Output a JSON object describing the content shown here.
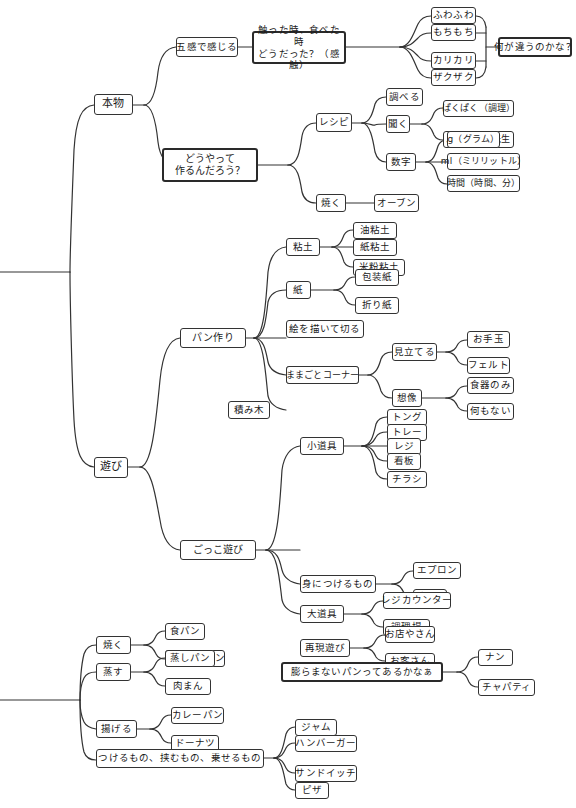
{
  "diagram": {
    "type": "mind-map",
    "language": "ja",
    "root_label": "",
    "nodes": {
      "honmono": "本物",
      "asobi": "遊び",
      "gokan": "五感で感じる",
      "sawatta": "触った時、食べた時\nどうだった？（感触）",
      "fuwafuwa": "ふわふわ",
      "mochimochi": "もちもち",
      "karikari": "カリカリ",
      "zakuzaku": "ザクザク",
      "nanigachigau": "何が違うのかな？",
      "douyatte": "どうやって\n作るんだろう？",
      "recipe": "レシピ",
      "shiraberu": "調べる",
      "kiku": "聞く",
      "pakupaku": "ぱくぱく（調理）",
      "pankyoushitsu": "パン教室の先生",
      "suuji": "数字",
      "gram": "g（グラム）",
      "ml": "ml（ミリリットル）",
      "jikan": "時間（時間、分）",
      "yaku_honmono": "焼く",
      "oven": "オーブン",
      "panzukuri": "パン作り",
      "nendo": "粘土",
      "abura_nendo": "油粘土",
      "kami_nendo": "紙粘土",
      "komeko_nendo": "米粉粘土",
      "kami": "紙",
      "housoushi": "包装紙",
      "origami": "折り紙",
      "e_wo_kaite": "絵を描いて切る",
      "mamagoto": "ままごとコーナー",
      "mitateru": "見立てる",
      "otedama": "お手玉",
      "felt": "フェルト",
      "souzou": "想像",
      "shokki_nomi": "食器のみ",
      "nanimonai": "何もない",
      "tsumiki": "積み木",
      "gokko": "ごっこ遊び",
      "kodougu": "小道具",
      "tong": "トング",
      "tray": "トレー",
      "reji": "レジ",
      "kanban": "看板",
      "chirashi": "チラシ",
      "mi_ni_tsukeru": "身につけるもの",
      "apron": "エプロン",
      "boushi": "帽子",
      "oodougu": "大道具",
      "reji_counter": "レジカウンター",
      "chourijou": "調理場",
      "saigen": "再現遊び",
      "omiseyasan": "お店やさん",
      "okyakusan": "お客さん",
      "yaku2": "焼く",
      "shokupan": "食パン",
      "cream_pan": "クリームパン",
      "musu": "蒸す",
      "mushipan": "蒸しパン",
      "nikuman": "肉まん",
      "ageru": "揚げる",
      "curry_pan": "カレーパン",
      "donut": "ドーナツ",
      "tsukeru": "つけるもの、挟むもの、乗せるもの",
      "jam": "ジャム",
      "hamburger": "ハンバーガー",
      "sandwich": "サンドイッチ",
      "pizza": "ピザ",
      "fukuramanai": "膨らまないパンってあるかなぁ",
      "nan": "ナン",
      "chapati": "チャパティ"
    },
    "colors": {
      "line": "#333333",
      "border": "#333333",
      "text": "#1a1a1a",
      "background": "#ffffff"
    }
  }
}
